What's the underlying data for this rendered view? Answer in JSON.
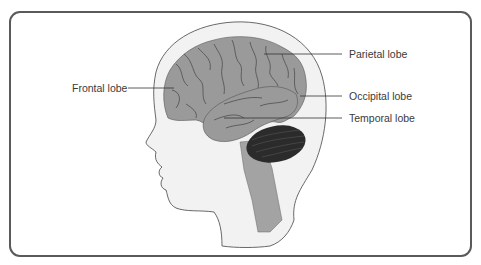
{
  "diagram": {
    "labels": {
      "frontal": "Frontal lobe",
      "parietal": "Parietal lobe",
      "occipital": "Occipital lobe",
      "temporal": "Temporal lobe"
    },
    "colors": {
      "frame_border": "#5a5a5a",
      "head_fill": "#f2f2f2",
      "head_outline": "#444444",
      "cerebrum_fill": "#9a9a9a",
      "cerebellum_fill": "#2b2b2b",
      "brainstem_fill": "#a3a3a3",
      "leader_line": "#333333"
    }
  }
}
